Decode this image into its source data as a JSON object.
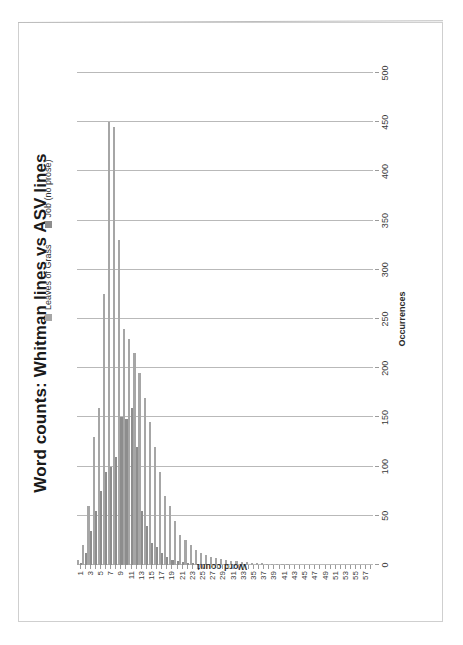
{
  "chart_data": {
    "type": "bar",
    "orientation": "horizontal",
    "title": "Word counts: Whitman lines vs ASV lines",
    "xlabel": "Occurrences",
    "ylabel": "Word count",
    "xlim": [
      0,
      500
    ],
    "xticks": [
      0,
      50,
      100,
      150,
      200,
      250,
      300,
      350,
      400,
      450,
      500
    ],
    "grid": true,
    "legend_position": "top-right",
    "categories": [
      1,
      2,
      3,
      4,
      5,
      6,
      7,
      8,
      9,
      10,
      11,
      12,
      13,
      14,
      15,
      16,
      17,
      18,
      19,
      20,
      21,
      22,
      23,
      24,
      25,
      26,
      27,
      28,
      29,
      30,
      31,
      32,
      33,
      34,
      35,
      36,
      37,
      38,
      39,
      40,
      41,
      42,
      43,
      44,
      45,
      46,
      47,
      48,
      49,
      50,
      51,
      52,
      53,
      54,
      55,
      56,
      57,
      58
    ],
    "category_tick_labels": [
      "1",
      "3",
      "5",
      "7",
      "9",
      "11",
      "13",
      "15",
      "17",
      "19",
      "21",
      "23",
      "25",
      "27",
      "29",
      "31",
      "33",
      "35",
      "37",
      "39",
      "41",
      "43",
      "45",
      "47",
      "49",
      "51",
      "53",
      "55",
      "57"
    ],
    "series": [
      {
        "name": "Leaves of Grass",
        "color": "#a6a6a6",
        "values": [
          5,
          20,
          60,
          130,
          160,
          275,
          450,
          445,
          330,
          240,
          230,
          215,
          195,
          170,
          145,
          120,
          95,
          70,
          60,
          45,
          30,
          25,
          20,
          15,
          12,
          10,
          8,
          7,
          6,
          5,
          4,
          4,
          3,
          3,
          2,
          2,
          2,
          1,
          1,
          1,
          1,
          1,
          0,
          0,
          0,
          0,
          0,
          0,
          0,
          0,
          0,
          0,
          0,
          0,
          0,
          0,
          0,
          0
        ]
      },
      {
        "name": "Job (no prose)",
        "color": "#8d8d8d",
        "values": [
          2,
          12,
          35,
          55,
          75,
          95,
          100,
          110,
          150,
          148,
          160,
          120,
          55,
          40,
          22,
          18,
          12,
          8,
          5,
          4,
          3,
          2,
          2,
          1,
          1,
          1,
          0,
          0,
          0,
          0,
          0,
          0,
          0,
          0,
          0,
          0,
          0,
          0,
          0,
          0,
          0,
          0,
          0,
          0,
          0,
          0,
          0,
          0,
          0,
          0,
          0,
          0,
          0,
          0,
          0,
          0,
          0,
          0
        ]
      }
    ]
  },
  "legend": {
    "items": [
      {
        "label": "Leaves of Grass"
      },
      {
        "label": "Job (no prose)"
      }
    ]
  }
}
